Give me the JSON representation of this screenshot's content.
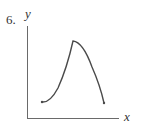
{
  "problem": {
    "number": "6.",
    "x_axis_label": "x",
    "y_axis_label": "y"
  },
  "graph": {
    "description": "Continuous curve on a closed interval rising (concave up) from a left endpoint to a sharp corner peak, then falling (concave down) to a right endpoint",
    "stroke_color": "#4a4a4a",
    "axis_color": "#6a6a6a",
    "points": {
      "left_endpoint": [
        42,
        102
      ],
      "peak_corner": [
        73,
        41
      ],
      "right_endpoint": [
        104,
        103
      ]
    }
  }
}
